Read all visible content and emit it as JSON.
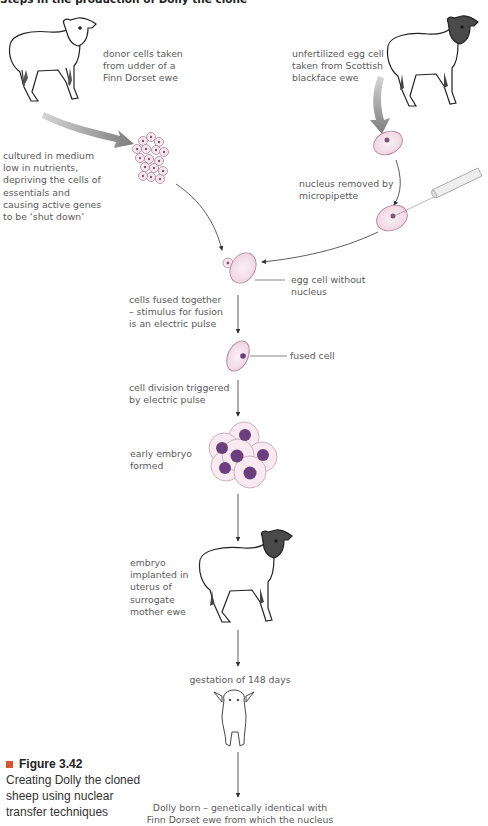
{
  "title": "Steps in the production of Dolly the clone",
  "labels": {
    "donor": "donor cells taken\nfrom udder of a\nFinn Dorset ewe",
    "unfertilized": "unfertilized egg cell\ntaken from Scottish\nblackface ewe",
    "cultured": "cultured in medium\nlow in nutrients,\ndepriving the cells of\nessentials and\ncausing active genes\nto be ‘shut down’",
    "nucleus_removed": "nucleus removed by\nmicropipette",
    "egg_without_nucleus": "egg cell without\nnucleus",
    "cells_fused": "cells fused together\n– stimulus for fusion\nis an electric pulse",
    "fused_cell": "fused cell",
    "cell_division": "cell division triggered\nby electric pulse",
    "early_embryo": "early embryo\nformed",
    "embryo_implanted": "embryo\nimplanted in\nuterus of\nsurrogate\nmother ewe",
    "gestation": "gestation of 148 days",
    "dolly_born": "Dolly born – genetically identical with\nFinn Dorset ewe from which the nucleus"
  },
  "caption": {
    "figure": "Figure 3.42",
    "text": "Creating Dolly the cloned sheep using nuclear transfer techniques"
  },
  "colors": {
    "cell_fill": "#f7e6ee",
    "cell_stroke": "#b8879c",
    "nucleus": "#6a3f7d",
    "arrow_grey": "#8f8f8f",
    "caption_marker": "#d9532b"
  }
}
